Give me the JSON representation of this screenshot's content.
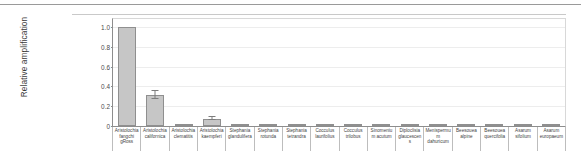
{
  "figure": {
    "ylabel": "Relative amplification"
  },
  "chart_data": {
    "type": "bar",
    "title": "",
    "xlabel": "",
    "ylabel": "Relative amplification",
    "ylim": [
      0,
      1.08
    ],
    "yticks": [
      "0",
      "0.2",
      "0.4",
      "0.6",
      "0.8",
      "1.0"
    ],
    "ytick_values": [
      0,
      0.2,
      0.4,
      0.6,
      0.8,
      1.0
    ],
    "grid": true,
    "legend": "none",
    "bar_color": "#c6c6c6",
    "bar_edge_color": "#8f8f8f",
    "error_color": "#7d7d7d",
    "categories": [
      "Aristolochia fangchi gRoss",
      "Aristolochia californica",
      "Aristolochia clematitis",
      "Aristolochia kaempferi",
      "Stephania glandulifera",
      "Stephania rotunda",
      "Stephania tetrandra",
      "Cocculus laurifolius",
      "Cocculus trilobus",
      "Sinomenium acutum",
      "Diploclisia glaucescens",
      "Menispermum dahuricum",
      "Beesouea alpine",
      "Beesouea quercifolia",
      "Asarum sifolium",
      "Asarum europaeum"
    ],
    "values": [
      1.0,
      0.313,
      0.005,
      0.075,
      0.003,
      0.003,
      0.003,
      0.003,
      0.003,
      0.003,
      0.003,
      0.003,
      0.003,
      0.003,
      0.003,
      0.003
    ],
    "errors": [
      0.0,
      0.044,
      0.0,
      0.016,
      0.0,
      0.0,
      0.0,
      0.0,
      0.0,
      0.0,
      0.0,
      0.0,
      0.0,
      0.0,
      0.0,
      0.0
    ]
  }
}
